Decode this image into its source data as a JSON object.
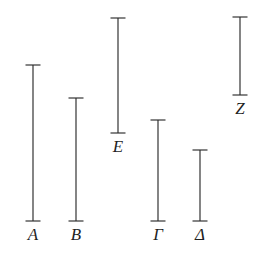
{
  "figure": {
    "background_color": "#ffffff",
    "stroke_color": "#2a2a2a",
    "label_color": "#1f1f1f",
    "width": 270,
    "height": 280
  },
  "chart_data": {
    "type": "bar",
    "orientation": "vertical",
    "xlabel": "",
    "ylabel": "",
    "grid": false,
    "legend": null,
    "axis_visible": false,
    "note": "Classical geometric diagram: each magnitude is drawn as a vertical line with short horizontal serif caps at both ends. Values are segment lengths in pixels; y measured downward from the top of the image.",
    "categories": [
      "A",
      "B",
      "Γ",
      "Δ",
      "E",
      "Z"
    ],
    "values": [
      156,
      123,
      101,
      71,
      115,
      78
    ],
    "segments": [
      {
        "label": "A",
        "x": 33,
        "top": 65,
        "bottom": 221,
        "length": 156,
        "cap_width": 15,
        "label_x": 33,
        "label_y": 226
      },
      {
        "label": "B",
        "x": 76,
        "top": 98,
        "bottom": 221,
        "length": 123,
        "cap_width": 15,
        "label_x": 76,
        "label_y": 226
      },
      {
        "label": "Γ",
        "x": 158,
        "top": 120,
        "bottom": 221,
        "length": 101,
        "cap_width": 15,
        "label_x": 158,
        "label_y": 226
      },
      {
        "label": "Δ",
        "x": 200,
        "top": 150,
        "bottom": 221,
        "length": 71,
        "cap_width": 15,
        "label_x": 200,
        "label_y": 226
      },
      {
        "label": "E",
        "x": 118,
        "top": 18,
        "bottom": 133,
        "length": 115,
        "cap_width": 15,
        "label_x": 118,
        "label_y": 138
      },
      {
        "label": "Z",
        "x": 240,
        "top": 17,
        "bottom": 95,
        "length": 78,
        "cap_width": 15,
        "label_x": 240,
        "label_y": 100
      }
    ]
  }
}
